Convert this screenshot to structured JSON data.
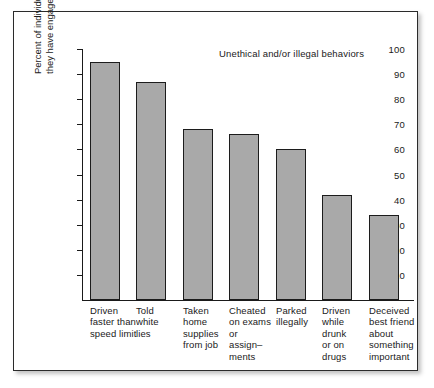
{
  "figure": {
    "title": "Unethical and/or illegal behaviors",
    "ylabel_line1": "Percent of individuals admitting",
    "ylabel_line2": "they have engaged in unethical behaviors",
    "frame_color": "#2b2b2b",
    "bar_fill_color": "#a9a9a9",
    "bar_edge_color": "#1c1c1c",
    "background_color": "#ffffff"
  },
  "yaxis": {
    "ticks": [
      {
        "value": 10,
        "label": "10"
      },
      {
        "value": 20,
        "label": "20"
      },
      {
        "value": 30,
        "label": "30"
      },
      {
        "value": 40,
        "label": "40"
      },
      {
        "value": 50,
        "label": "50"
      },
      {
        "value": 60,
        "label": "60"
      },
      {
        "value": 70,
        "label": "70"
      },
      {
        "value": 80,
        "label": "80"
      },
      {
        "value": 90,
        "label": "90"
      },
      {
        "value": 100,
        "label": "100"
      }
    ]
  },
  "categories": [
    {
      "lines": [
        "Driven",
        "faster than",
        "speed limit"
      ]
    },
    {
      "lines": [
        "Told",
        "white",
        "lies"
      ]
    },
    {
      "lines": [
        "Taken",
        "home",
        "supplies",
        "from job"
      ]
    },
    {
      "lines": [
        "Cheated",
        "on exams",
        "or",
        "assign–",
        "ments"
      ]
    },
    {
      "lines": [
        "Parked",
        "illegally"
      ]
    },
    {
      "lines": [
        "Driven",
        "while",
        "drunk",
        "or on",
        "drugs"
      ]
    },
    {
      "lines": [
        "Deceived",
        "best friend",
        "about",
        "something",
        "important"
      ]
    }
  ],
  "chart_data": {
    "type": "bar",
    "title": "Unethical and/or illegal behaviors",
    "xlabel": "",
    "ylabel": "Percent of individuals admitting they have engaged in unethical behaviors",
    "ylim": [
      0,
      100
    ],
    "grid": false,
    "legend": "none",
    "categories": [
      "Driven faster than speed limit",
      "Told white lies",
      "Taken home supplies from job",
      "Cheated on exams or assignments",
      "Parked illegally",
      "Driven while drunk or on drugs",
      "Deceived best friend about something important"
    ],
    "values": [
      95,
      87,
      68,
      66,
      60,
      42,
      34
    ],
    "ytick_labels": [
      "10",
      "20",
      "30",
      "40",
      "50",
      "60",
      "70",
      "80",
      "90",
      "100"
    ],
    "ytick_values": [
      10,
      20,
      30,
      40,
      50,
      60,
      70,
      80,
      90,
      100
    ]
  },
  "layout": {
    "plot_height_px": 258,
    "baseline_offset_px": 258,
    "px_per_unit": 2.51,
    "bar_width_px": 30,
    "bar_left_positions_px": [
      8,
      54,
      101,
      147,
      194,
      240,
      287
    ]
  }
}
